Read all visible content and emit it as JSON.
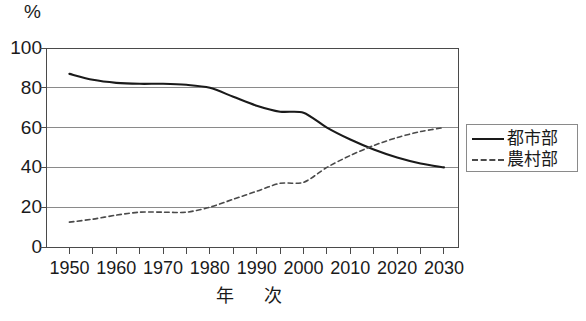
{
  "chart_data": {
    "type": "line",
    "title": "",
    "xlabel": "年　次",
    "ylabel": "",
    "unit_label": "%",
    "xlim": [
      1945,
      2033
    ],
    "ylim": [
      0,
      100
    ],
    "grid": "horizontal",
    "legend_position": "right",
    "x_tick_labels": [
      "1950",
      "1960",
      "1970",
      "1980",
      "1990",
      "2000",
      "2010",
      "2020",
      "2030"
    ],
    "x_tick_values": [
      1950,
      1960,
      1970,
      1980,
      1990,
      2000,
      2010,
      2020,
      2030
    ],
    "x_minor_tick_values": [
      1950,
      1955,
      1960,
      1965,
      1970,
      1975,
      1980,
      1985,
      1990,
      1995,
      2000,
      2005,
      2010,
      2015,
      2020,
      2025,
      2030
    ],
    "y_tick_labels": [
      "0",
      "20",
      "40",
      "60",
      "80",
      "100"
    ],
    "y_tick_values": [
      0,
      20,
      40,
      60,
      80,
      100
    ],
    "x": [
      1950,
      1955,
      1960,
      1965,
      1970,
      1975,
      1980,
      1985,
      1990,
      1995,
      2000,
      2005,
      2010,
      2015,
      2020,
      2025,
      2030
    ],
    "series": [
      {
        "name": "都市部",
        "style": "solid",
        "color": "#1a1a1a",
        "values": [
          87,
          84,
          82.5,
          82,
          82,
          81.5,
          80,
          75.5,
          71,
          68,
          67.5,
          60,
          54,
          49,
          45,
          42,
          40
        ]
      },
      {
        "name": "農村部",
        "style": "dashed",
        "color": "#4a4a4a",
        "values": [
          12.5,
          14,
          16,
          17.5,
          17.5,
          17.5,
          20,
          24,
          28,
          32,
          32.5,
          40,
          46,
          51,
          55,
          58,
          60
        ]
      }
    ],
    "legend_entries": [
      {
        "label": "都市部",
        "style": "solid"
      },
      {
        "label": "農村部",
        "style": "dashed"
      }
    ],
    "annotations": []
  },
  "colors": {
    "axis": "#4a4a4a",
    "grid": "#8a8a8a",
    "urban_line": "#1a1a1a",
    "rural_line": "#4a4a4a",
    "text": "#1a1a1a",
    "background": "#ffffff"
  }
}
